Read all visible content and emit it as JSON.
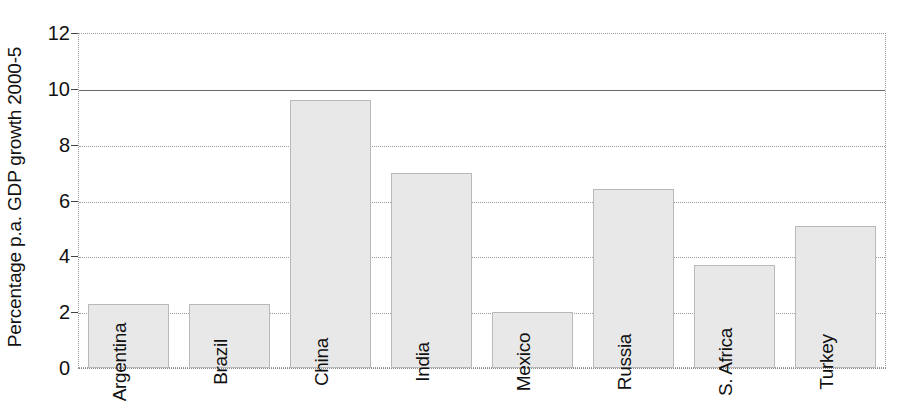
{
  "chart_data": {
    "type": "bar",
    "title": "",
    "subtitle": "",
    "xlabel": "",
    "ylabel": "Percentage p.a. GDP growth 2000-5",
    "categories": [
      "Argentina",
      "Brazil",
      "China",
      "India",
      "Mexico",
      "Russia",
      "S. Africa",
      "Turkey"
    ],
    "values": [
      2.3,
      2.3,
      9.6,
      7.0,
      2.0,
      6.4,
      3.7,
      5.1
    ],
    "ylim": [
      0,
      12
    ],
    "yticks": [
      0,
      2,
      4,
      6,
      8,
      10,
      12
    ],
    "ytick_labels": [
      "0",
      "2",
      "4",
      "6",
      "8",
      "10",
      "12"
    ],
    "grid": true,
    "grid_axis": "y",
    "legend": false,
    "legend_position": "none",
    "bar_fill_color": "#e8e8e8",
    "bar_border_color": "#b9b9b9",
    "gridline_color": "#9a9a9a",
    "emphasis_gridline_value": 10,
    "emphasis_gridline_color": "#6a6a6a",
    "text_color": "#111111",
    "background_color": "#ffffff",
    "labels_inside_bars": true,
    "label_rotation_degrees": -90
  }
}
